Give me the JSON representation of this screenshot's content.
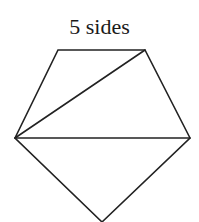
{
  "title": "5 sides",
  "colors": {
    "background": "#ffffff",
    "stroke": "#222222",
    "text": "#1a1a1a"
  },
  "shape": {
    "name": "pentagon",
    "sides": 5,
    "vertices": {
      "top_left": [
        58,
        50
      ],
      "top_right": [
        145,
        50
      ],
      "right": [
        190,
        138
      ],
      "bottom": [
        102,
        222
      ],
      "left": [
        15,
        138
      ]
    },
    "diagonals": [
      {
        "from": "left",
        "to": "top_right"
      },
      {
        "from": "left",
        "to": "right"
      }
    ]
  }
}
